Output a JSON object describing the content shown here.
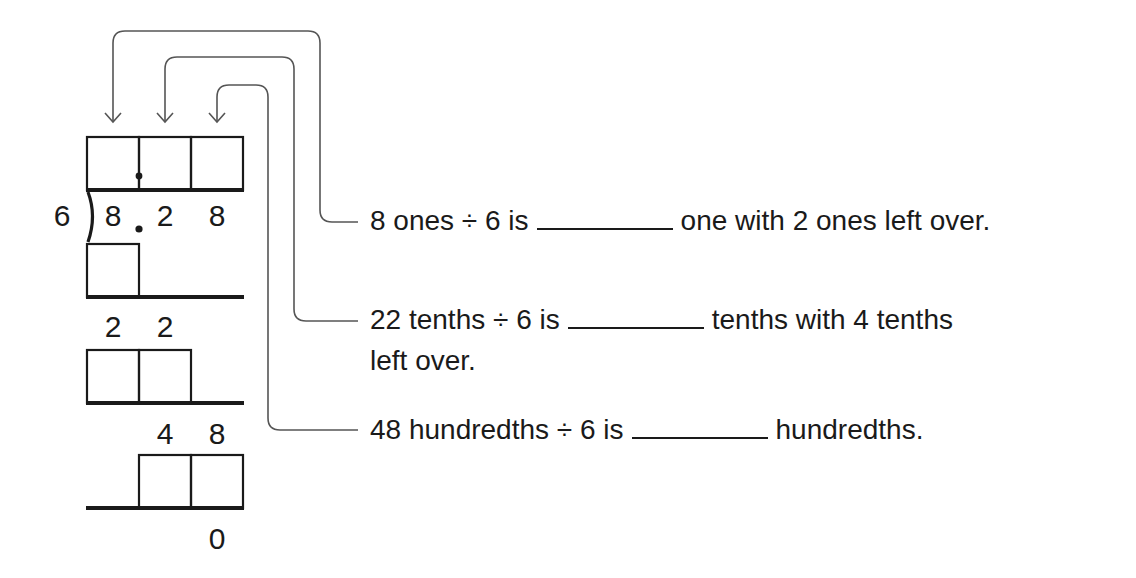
{
  "division": {
    "divisor": "6",
    "dividend_digits": [
      "8",
      ".",
      "2",
      "8"
    ],
    "quotient_boxes": 3,
    "quotient_decimal_point": true,
    "steps": [
      {
        "subtract_boxes": 1,
        "remainder_digits": [
          "2",
          "2"
        ]
      },
      {
        "subtract_boxes": 2,
        "remainder_digits": [
          "4",
          "8"
        ]
      },
      {
        "subtract_boxes": 2,
        "remainder_digits": [
          "0"
        ]
      }
    ]
  },
  "statements": [
    {
      "before": "8 ones ÷ 6 is",
      "after": "one with 2 ones left over.",
      "blank": ""
    },
    {
      "before": "22 tenths ÷ 6 is",
      "after": "tenths with 4 tenths",
      "continuation": "left over.",
      "blank": ""
    },
    {
      "before": "48 hundredths ÷ 6 is",
      "after": "hundredths.",
      "blank": ""
    }
  ],
  "colors": {
    "ink": "#1a1a1a",
    "connector": "#555555",
    "background": "#ffffff"
  }
}
